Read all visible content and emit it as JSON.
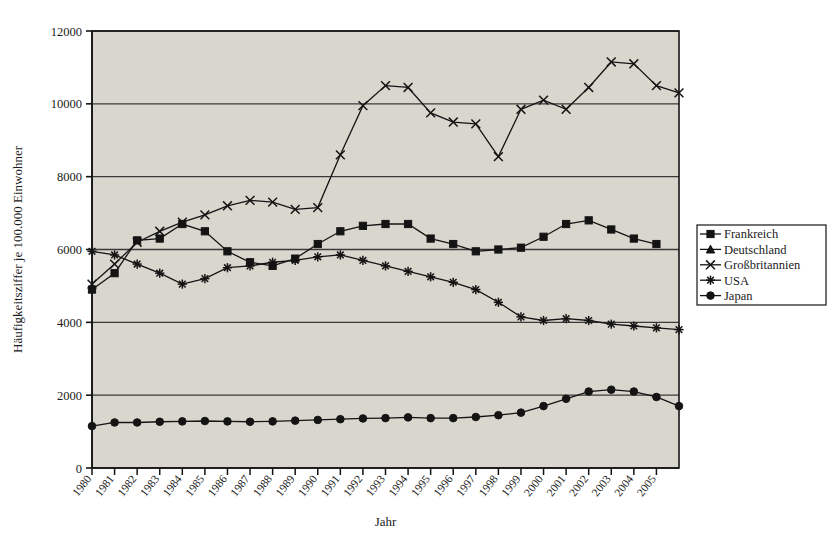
{
  "chart_data": {
    "type": "line",
    "title": "",
    "xlabel": "Jahr",
    "ylabel": "Häufigkeitsziffer je 100.000 Einwohner",
    "xlim": [
      1980,
      2006
    ],
    "ylim": [
      0,
      12000
    ],
    "grid": true,
    "legend_position": "right",
    "ytick_labels": [
      "0",
      "2000",
      "4000",
      "6000",
      "8000",
      "10000",
      "12000"
    ],
    "ytick_values": [
      0,
      2000,
      4000,
      6000,
      8000,
      10000,
      12000
    ],
    "xtick_labels": [
      "1980",
      "1981",
      "1982",
      "1983",
      "1984",
      "1985",
      "1986",
      "1987",
      "1988",
      "1989",
      "1990",
      "1991",
      "1992",
      "1993",
      "1994",
      "1995",
      "1996",
      "1997",
      "1998",
      "1999",
      "2000",
      "2001",
      "2002",
      "2003",
      "2004",
      "2005"
    ],
    "x": [
      1980,
      1981,
      1982,
      1983,
      1984,
      1985,
      1986,
      1987,
      1988,
      1989,
      1990,
      1991,
      1992,
      1993,
      1994,
      1995,
      1996,
      1997,
      1998,
      1999,
      2000,
      2001,
      2002,
      2003,
      2004,
      2005,
      2006
    ],
    "series": [
      {
        "name": "Frankreich",
        "marker": "square",
        "color": "#141414",
        "values": [
          4900,
          5350,
          6250,
          6300,
          6700,
          6500,
          5950,
          5650,
          5550,
          5750,
          6150,
          6500,
          6650,
          6700,
          6700,
          6300,
          6150,
          5950,
          6000,
          6050,
          6350,
          6700,
          6800,
          6550,
          6300,
          6150,
          null
        ]
      },
      {
        "name": "Deutschland",
        "marker": "triangle",
        "color": "#141414",
        "values": [
          null,
          null,
          null,
          null,
          null,
          null,
          null,
          null,
          null,
          null,
          null,
          null,
          null,
          null,
          null,
          null,
          null,
          null,
          null,
          null,
          null,
          null,
          null,
          null,
          null,
          null,
          null
        ]
      },
      {
        "name": "Großbritannien",
        "marker": "cross",
        "color": "#141414",
        "values": [
          5050,
          5600,
          6200,
          6500,
          6750,
          6950,
          7200,
          7350,
          7300,
          7100,
          7150,
          8600,
          9950,
          10500,
          10450,
          9750,
          9500,
          9450,
          8550,
          9850,
          10100,
          9850,
          10450,
          11150,
          11100,
          10500,
          10300
        ]
      },
      {
        "name": "USA",
        "marker": "star",
        "color": "#141414",
        "values": [
          5950,
          5850,
          5600,
          5350,
          5050,
          5200,
          5500,
          5550,
          5650,
          5700,
          5800,
          5850,
          5700,
          5550,
          5400,
          5250,
          5100,
          4900,
          4550,
          4150,
          4050,
          4100,
          4050,
          3950,
          3900,
          3850,
          3800
        ]
      },
      {
        "name": "Japan",
        "marker": "circle",
        "color": "#141414",
        "values": [
          1150,
          1250,
          1250,
          1270,
          1280,
          1290,
          1280,
          1270,
          1280,
          1300,
          1320,
          1340,
          1360,
          1370,
          1390,
          1370,
          1370,
          1400,
          1450,
          1520,
          1700,
          1900,
          2100,
          2150,
          2100,
          1950,
          1700
        ]
      }
    ]
  },
  "plot": {
    "background_color": "#d9d6cd",
    "border_color": "#141414",
    "gridline_color": "#3a3a3a"
  },
  "legend": {
    "entries": [
      {
        "label": "Frankreich"
      },
      {
        "label": "Deutschland"
      },
      {
        "label": "Großbritannien"
      },
      {
        "label": "USA"
      },
      {
        "label": "Japan"
      }
    ]
  }
}
